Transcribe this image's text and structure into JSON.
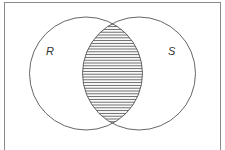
{
  "diagram": {
    "type": "venn",
    "universe": {
      "x": 4,
      "y": 2,
      "width": 217,
      "height": 160,
      "stroke": "#888888"
    },
    "sets": [
      {
        "label": "R",
        "cx": 86,
        "cy": 73.5,
        "r": 56.5,
        "label_x": 47,
        "label_y": 55
      },
      {
        "label": "S",
        "cx": 139,
        "cy": 73.5,
        "r": 56.5,
        "label_x": 169,
        "label_y": 55
      }
    ],
    "shaded_region": "R ∩ S",
    "hatch": {
      "style": "horizontal",
      "spacing": 2.8,
      "color": "#555555"
    },
    "stroke_color": "#555555"
  }
}
